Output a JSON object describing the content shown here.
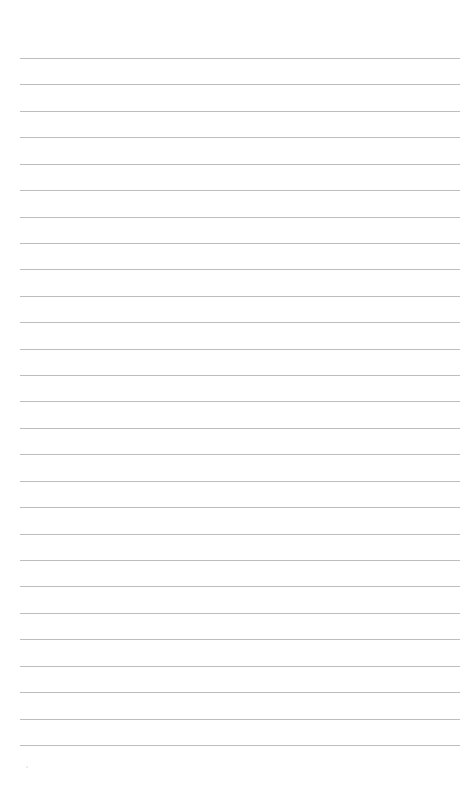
{
  "page": {
    "type": "lined-paper",
    "background_color": "#ffffff",
    "rule_color": "#bdbdbd",
    "rule_count": 27,
    "first_rule_y": 58,
    "rule_spacing": 26.42,
    "rule_left": 20,
    "rule_width": 440,
    "text_lines": []
  }
}
